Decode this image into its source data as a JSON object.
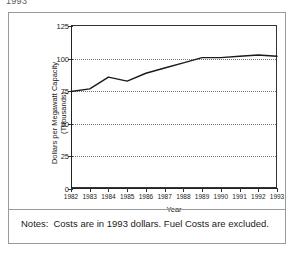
{
  "top_caption": "1993",
  "chart_data": {
    "type": "line",
    "title": "",
    "xlabel": "Year",
    "ylabel": "Dollars per Megawatt Capacity (Thousands)",
    "ylabel_line1": "Dollars per Megawatt Capacity",
    "ylabel_line2": "(Thousands)",
    "x": [
      1982,
      1983,
      1984,
      1985,
      1986,
      1987,
      1988,
      1989,
      1990,
      1991,
      1992,
      1993
    ],
    "values": [
      74,
      76,
      85,
      82,
      88,
      92,
      96,
      100,
      100,
      101,
      102,
      101
    ],
    "categories": [
      "1982",
      "1983",
      "1984",
      "1985",
      "1986",
      "1987",
      "1988",
      "1989",
      "1990",
      "1991",
      "1992",
      "1993"
    ],
    "xtick_labels": [
      "1982",
      "1983",
      "1984",
      "1985",
      "1986",
      "1987",
      "1988",
      "1989",
      "1990",
      "1991",
      "1992",
      "1993"
    ],
    "ytick_labels": [
      "125",
      "100",
      "75",
      "50",
      "25",
      "0"
    ],
    "yticks": [
      125,
      100,
      75,
      50,
      25,
      0
    ],
    "ylim": [
      0,
      125
    ],
    "xlim": [
      1982,
      1993
    ],
    "grid": true,
    "grid_axis": "y",
    "grid_style": "dotted",
    "legend": false,
    "legend_position": "none",
    "line_color": "#1a1a1a",
    "series": [
      {
        "name": "Dollars per Megawatt Capacity",
        "values": [
          74,
          76,
          85,
          82,
          88,
          92,
          96,
          100,
          100,
          101,
          102,
          101
        ]
      }
    ]
  },
  "notes": {
    "label": "Notes:",
    "text": "Costs are in 1993 dollars. Fuel Costs are excluded."
  }
}
